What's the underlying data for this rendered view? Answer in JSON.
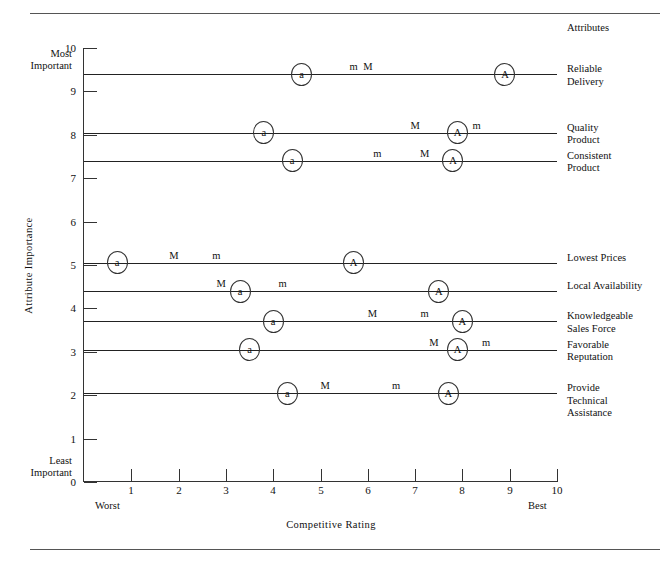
{
  "header": {
    "attributes_heading": "Attributes"
  },
  "axes": {
    "y_title": "Attribute Importance",
    "x_title": "Competitive Rating",
    "most_important": "Most\nImportant",
    "least_important": "Least\nImportant",
    "worst": "Worst",
    "best": "Best",
    "y_ticks": [
      "0",
      "1",
      "2",
      "3",
      "4",
      "5",
      "6",
      "7",
      "8",
      "9",
      "10"
    ],
    "x_ticks": [
      "1",
      "2",
      "3",
      "4",
      "5",
      "6",
      "7",
      "8",
      "9",
      "10"
    ]
  },
  "legend_symbols": {
    "a": "a",
    "m": "m",
    "M": "M",
    "A": "A"
  },
  "chart_data": {
    "type": "scatter",
    "title": "",
    "xlabel": "Competitive Rating",
    "ylabel": "Attribute Importance",
    "xlim": [
      0,
      10
    ],
    "ylim": [
      0,
      10
    ],
    "grid": false,
    "x_axis_endpoint_labels": {
      "low": "Worst",
      "high": "Best"
    },
    "y_axis_endpoint_labels": {
      "low": "Least Important",
      "high": "Most Important"
    },
    "series_names": [
      "a",
      "m",
      "M",
      "A"
    ],
    "rows": [
      {
        "attribute": "Reliable Delivery",
        "importance": 9.4,
        "markers": [
          {
            "symbol": "a",
            "rating": 4.6,
            "circled": true
          },
          {
            "symbol": "m",
            "rating": 5.7,
            "circled": false
          },
          {
            "symbol": "M",
            "rating": 6.0,
            "circled": false
          },
          {
            "symbol": "A",
            "rating": 8.9,
            "circled": true
          }
        ]
      },
      {
        "attribute": "Quality Product",
        "importance": 8.05,
        "markers": [
          {
            "symbol": "a",
            "rating": 3.8,
            "circled": true
          },
          {
            "symbol": "M",
            "rating": 7.0,
            "circled": false
          },
          {
            "symbol": "A",
            "rating": 7.9,
            "circled": true
          },
          {
            "symbol": "m",
            "rating": 8.3,
            "circled": false
          }
        ]
      },
      {
        "attribute": "Consistent Product",
        "importance": 7.4,
        "markers": [
          {
            "symbol": "a",
            "rating": 4.4,
            "circled": true
          },
          {
            "symbol": "m",
            "rating": 6.2,
            "circled": false
          },
          {
            "symbol": "M",
            "rating": 7.2,
            "circled": false
          },
          {
            "symbol": "A",
            "rating": 7.8,
            "circled": true
          }
        ]
      },
      {
        "attribute": "Lowest Prices",
        "importance": 5.05,
        "markers": [
          {
            "symbol": "a",
            "rating": 0.7,
            "circled": true
          },
          {
            "symbol": "M",
            "rating": 1.9,
            "circled": false
          },
          {
            "symbol": "m",
            "rating": 2.8,
            "circled": false
          },
          {
            "symbol": "A",
            "rating": 5.7,
            "circled": true
          }
        ]
      },
      {
        "attribute": "Local Availability",
        "importance": 4.4,
        "markers": [
          {
            "symbol": "M",
            "rating": 2.9,
            "circled": false
          },
          {
            "symbol": "a",
            "rating": 3.3,
            "circled": true
          },
          {
            "symbol": "m",
            "rating": 4.2,
            "circled": false
          },
          {
            "symbol": "A",
            "rating": 7.5,
            "circled": true
          }
        ]
      },
      {
        "attribute": "Knowledgeable Sales Force",
        "importance": 3.7,
        "markers": [
          {
            "symbol": "a",
            "rating": 4.0,
            "circled": true
          },
          {
            "symbol": "M",
            "rating": 6.1,
            "circled": false
          },
          {
            "symbol": "m",
            "rating": 7.2,
            "circled": false
          },
          {
            "symbol": "A",
            "rating": 8.0,
            "circled": true
          }
        ]
      },
      {
        "attribute": "Favorable Reputation",
        "importance": 3.05,
        "markers": [
          {
            "symbol": "a",
            "rating": 3.5,
            "circled": true
          },
          {
            "symbol": "M",
            "rating": 7.4,
            "circled": false
          },
          {
            "symbol": "A",
            "rating": 7.9,
            "circled": true
          },
          {
            "symbol": "m",
            "rating": 8.5,
            "circled": false
          }
        ]
      },
      {
        "attribute": "Provide Technical Assistance",
        "importance": 2.05,
        "markers": [
          {
            "symbol": "a",
            "rating": 4.3,
            "circled": true
          },
          {
            "symbol": "M",
            "rating": 5.1,
            "circled": false
          },
          {
            "symbol": "m",
            "rating": 6.6,
            "circled": false
          },
          {
            "symbol": "A",
            "rating": 7.7,
            "circled": true
          }
        ]
      }
    ],
    "attribute_label_lines": [
      [
        "Reliable",
        "Delivery"
      ],
      [
        "Quality",
        "Product"
      ],
      [
        "Consistent",
        "Product"
      ],
      [
        "Lowest Prices"
      ],
      [
        "Local Availability"
      ],
      [
        "Knowledgeable",
        "Sales Force"
      ],
      [
        "Favorable",
        "Reputation"
      ],
      [
        "Provide",
        "Technical",
        "Assistance"
      ]
    ]
  }
}
